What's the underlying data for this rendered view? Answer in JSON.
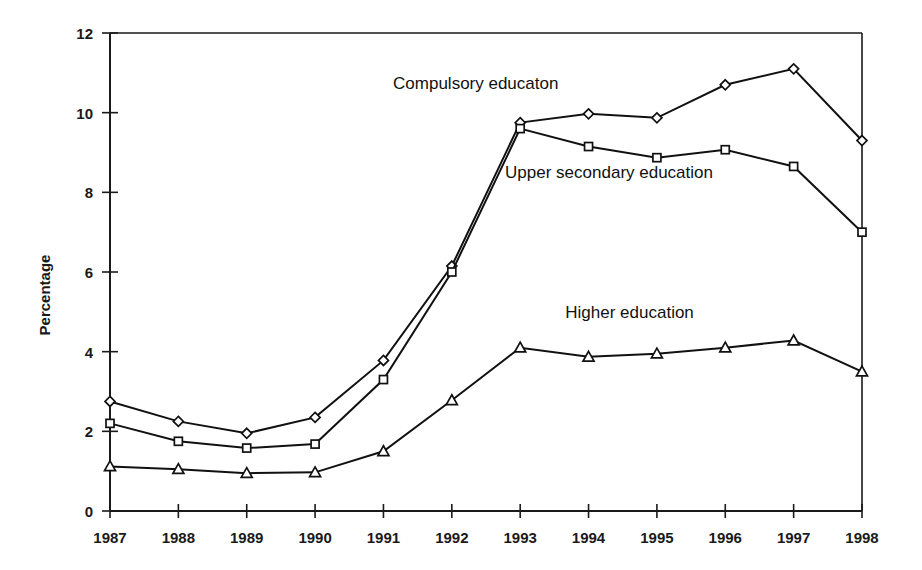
{
  "chart_data": {
    "type": "line",
    "title": "",
    "subtitle": "",
    "xlabel": "",
    "ylabel": "Percentage",
    "categories": [
      "1987",
      "1988",
      "1989",
      "1990",
      "1991",
      "1992",
      "1993",
      "1994",
      "1995",
      "1996",
      "1997",
      "1998"
    ],
    "x": [
      1987,
      1988,
      1989,
      1990,
      1991,
      1992,
      1993,
      1994,
      1995,
      1996,
      1997,
      1998
    ],
    "ylim": [
      0,
      12
    ],
    "xlim": [
      1987,
      1998
    ],
    "y_ticks": [
      "0",
      "2",
      "4",
      "6",
      "8",
      "10",
      "12"
    ],
    "y_tick_values": [
      0,
      2,
      4,
      6,
      8,
      10,
      12
    ],
    "grid": false,
    "legend_position": "inline-annotations",
    "series": [
      {
        "name": "Compulsory educaton",
        "marker": "diamond",
        "values": [
          2.75,
          2.25,
          1.95,
          2.35,
          3.78,
          6.15,
          9.75,
          9.97,
          9.87,
          10.7,
          11.1,
          9.3
        ],
        "label_x": 1992.35,
        "label_y": 10.6
      },
      {
        "name": "Upper secondary education",
        "marker": "square",
        "values": [
          2.2,
          1.75,
          1.58,
          1.68,
          3.3,
          6.0,
          9.6,
          9.15,
          8.87,
          9.07,
          8.65,
          7.0
        ],
        "label_x": 1994.3,
        "label_y": 8.35
      },
      {
        "name": "Higher education",
        "marker": "triangle",
        "values": [
          1.12,
          1.05,
          0.95,
          0.97,
          1.5,
          2.78,
          4.1,
          3.87,
          3.95,
          4.1,
          4.28,
          3.5
        ],
        "label_x": 1994.6,
        "label_y": 4.85
      }
    ],
    "annotations": [
      {
        "text": "Compulsory educaton",
        "series": "Compulsory educaton"
      },
      {
        "text": "Upper secondary education",
        "series": "Upper secondary education"
      },
      {
        "text": "Higher education",
        "series": "Higher education"
      }
    ],
    "colors": {
      "line": "#111111",
      "marker_fill": "#ffffff",
      "axis": "#1a1a1a",
      "background": "#ffffff"
    }
  }
}
